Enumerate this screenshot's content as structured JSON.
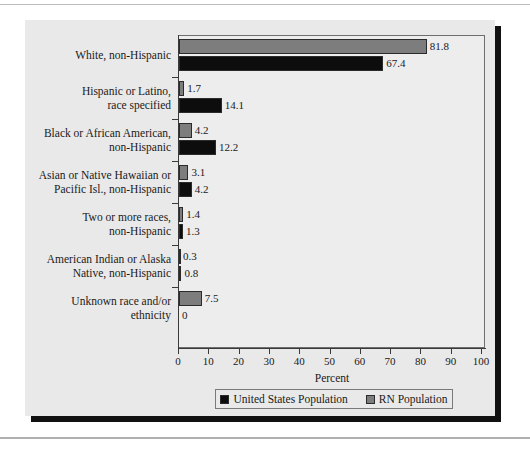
{
  "chart_data": {
    "type": "bar",
    "orientation": "horizontal",
    "title": "",
    "xlabel": "Percent",
    "ylabel": "",
    "xlim": [
      0,
      100
    ],
    "xticks": [
      0,
      10,
      20,
      30,
      40,
      50,
      60,
      70,
      80,
      90,
      100
    ],
    "grid": false,
    "legend_position": "bottom",
    "categories": [
      [
        "White, non-Hispanic"
      ],
      [
        "Hispanic or Latino,",
        "race specified"
      ],
      [
        "Black or African American,",
        "non-Hispanic"
      ],
      [
        "Asian or Native Hawaiian or",
        "Pacific Isl., non-Hispanic"
      ],
      [
        "Two or more races,",
        "non-Hispanic"
      ],
      [
        "American Indian or Alaska",
        "Native, non-Hispanic"
      ],
      [
        "Unknown race and/or",
        "ethnicity"
      ]
    ],
    "series": [
      {
        "name": "RN Population",
        "color": "#7d7d7d",
        "values": [
          81.8,
          1.7,
          4.2,
          3.1,
          1.4,
          0.3,
          7.5
        ],
        "labels": [
          "81.8",
          "1.7",
          "4.2",
          "3.1",
          "1.4",
          "0.3",
          "7.5"
        ]
      },
      {
        "name": "United States Population",
        "color": "#0d0d0d",
        "values": [
          67.4,
          14.1,
          12.2,
          4.2,
          1.3,
          0.8,
          0
        ],
        "labels": [
          "67.4",
          "14.1",
          "12.2",
          "4.2",
          "1.3",
          "0.8",
          "0"
        ]
      }
    ]
  },
  "legend": {
    "entries": [
      {
        "label": "United States Population",
        "swatch": "us"
      },
      {
        "label": "RN Population",
        "swatch": "rn"
      }
    ]
  }
}
